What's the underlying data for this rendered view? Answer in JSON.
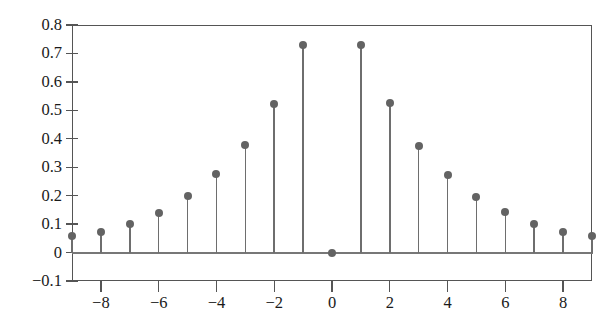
{
  "figure": {
    "background_color": "#ffffff",
    "stem_color": "#6e6e6e",
    "marker_color": "#636363",
    "axis_color": "#555555",
    "baseline_color": "#777777"
  },
  "chart_data": {
    "type": "stem",
    "title": "",
    "xlabel": "",
    "ylabel": "",
    "x": [
      -9,
      -8,
      -7,
      -6,
      -5,
      -4,
      -3,
      -2,
      -1,
      0,
      1,
      2,
      3,
      4,
      5,
      6,
      7,
      8,
      9
    ],
    "values": [
      0.057,
      0.072,
      0.102,
      0.14,
      0.198,
      0.275,
      0.378,
      0.524,
      0.73,
      0.0,
      0.73,
      0.527,
      0.375,
      0.274,
      0.196,
      0.141,
      0.099,
      0.074,
      0.058
    ],
    "xlim": [
      -9,
      9
    ],
    "ylim": [
      -0.1,
      0.8
    ],
    "grid": false,
    "legend": null,
    "baseline": 0,
    "y_ticks": [
      0.8,
      0.7,
      0.6,
      0.5,
      0.4,
      0.3,
      0.2,
      0.1,
      0,
      -0.1
    ],
    "y_tick_labels": [
      "0.8",
      "0.7",
      "0.6",
      "0.5",
      "0.4",
      "0.3",
      "0.2",
      "0.1",
      "0",
      "−0.1"
    ],
    "x_ticks": [
      -8,
      -6,
      -4,
      -2,
      0,
      2,
      4,
      6,
      8
    ],
    "x_tick_labels": [
      "−8",
      "−6",
      "−4",
      "−2",
      "0",
      "2",
      "4",
      "6",
      "8"
    ]
  }
}
